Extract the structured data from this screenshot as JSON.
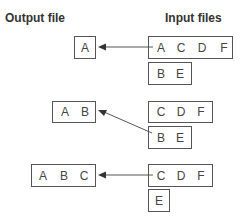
{
  "headers": {
    "output": "Output file",
    "input": "Input files"
  },
  "steps": [
    {
      "output": [
        "A"
      ],
      "inputs": [
        [
          "A",
          "C",
          "D",
          "F"
        ],
        [
          "B",
          "E"
        ]
      ]
    },
    {
      "output": [
        "A",
        "B"
      ],
      "inputs": [
        [
          "C",
          "D",
          "F"
        ],
        [
          "B",
          "E"
        ]
      ]
    },
    {
      "output": [
        "A",
        "B",
        "C"
      ],
      "inputs": [
        [
          "C",
          "D",
          "F"
        ],
        [
          "E"
        ]
      ]
    }
  ],
  "colors": {
    "line": "#555555",
    "text": "#444444"
  }
}
